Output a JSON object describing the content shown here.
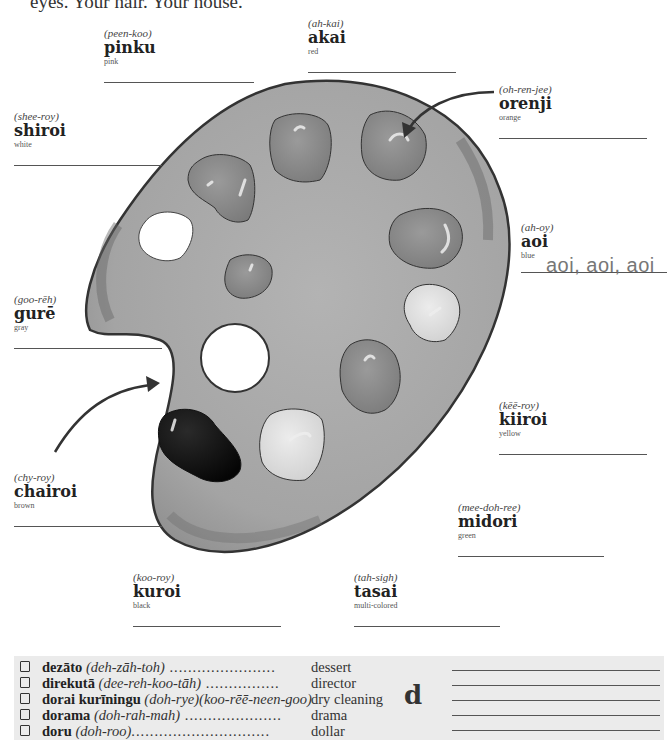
{
  "header": {
    "partial_text": "eyes. Your hair. Your house."
  },
  "palette": {
    "colors": {
      "board": "#a9a9a9",
      "board_shadow": "#6f6f6f",
      "outline": "#333333",
      "paint_mid": "#8a8a8a",
      "paint_dark": "#111111",
      "paint_light": "#d9d9d9",
      "hole": "#ffffff"
    }
  },
  "labels": [
    {
      "id": "pinku",
      "pron": "(peen-koo)",
      "word": "pinku",
      "eng": "pink"
    },
    {
      "id": "akai",
      "pron": "(ah-kai)",
      "word": "akai",
      "eng": "red"
    },
    {
      "id": "orenji",
      "pron": "(oh-ren-jee)",
      "word": "orenji",
      "eng": "orange"
    },
    {
      "id": "shiroi",
      "pron": "(shee-roy)",
      "word": "shiroi",
      "eng": "white"
    },
    {
      "id": "aoi",
      "pron": "(ah-oy)",
      "word": "aoi",
      "eng": "blue"
    },
    {
      "id": "gure",
      "pron": "(goo-rēh)",
      "word": "gurē",
      "eng": "gray"
    },
    {
      "id": "kiiroi",
      "pron": "(kēē-roy)",
      "word": "kiiroi",
      "eng": "yellow"
    },
    {
      "id": "chairoi",
      "pron": "(chy-roy)",
      "word": "chairoi",
      "eng": "brown"
    },
    {
      "id": "midori",
      "pron": "(mee-doh-ree)",
      "word": "midori",
      "eng": "green"
    },
    {
      "id": "kuroi",
      "pron": "(koo-roy)",
      "word": "kuroi",
      "eng": "black"
    },
    {
      "id": "tasai",
      "pron": "(tah-sigh)",
      "word": "tasai",
      "eng": "multi-colored"
    }
  ],
  "practice_example": "aoi, aoi, aoi",
  "vocab": {
    "letter": "d",
    "rows": [
      {
        "jp": "dezāto",
        "pron": "(deh-zāh-toh)",
        "dots": " .......................",
        "en": "dessert"
      },
      {
        "jp": "direkutā",
        "pron": "(dee-reh-koo-tāh)",
        "dots": " ................",
        "en": "director"
      },
      {
        "jp": "dorai kurīningu",
        "pron": "(doh-rye)(koo-rēē-neen-goo)",
        "dots": "",
        "en": "dry cleaning"
      },
      {
        "jp": "dorama",
        "pron": "(doh-rah-mah)",
        "dots": " .....................",
        "en": "drama"
      },
      {
        "jp": "doru",
        "pron": "(doh-roo)",
        "dots": "..............................",
        "en": "dollar"
      }
    ]
  }
}
